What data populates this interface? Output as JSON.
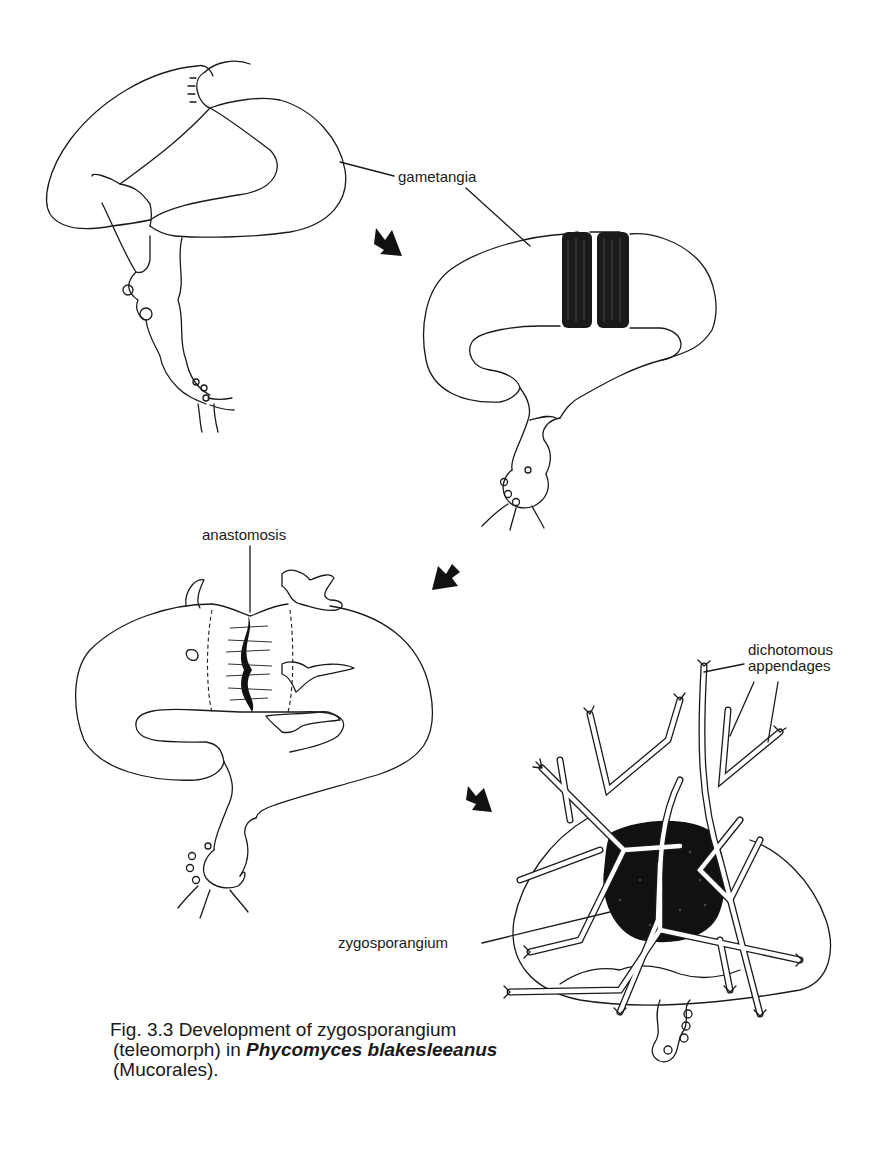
{
  "figure": {
    "labels": {
      "gametangia": "gametangia",
      "anastomosis": "anastomosis",
      "dichotomous_line1": "dichotomous",
      "dichotomous_line2": "appendages",
      "zygosporangium": "zygosporangium"
    },
    "stages": [
      {
        "id": 1,
        "description": "Gametangia in contact (early stage)"
      },
      {
        "id": 2,
        "description": "Gametangia with dark septal zones"
      },
      {
        "id": 3,
        "description": "Anastomosis between gametangia"
      },
      {
        "id": 4,
        "description": "Mature zygosporangium with dichotomous appendages"
      }
    ],
    "arrows": [
      {
        "from_stage": 1,
        "to_stage": 2,
        "direction": "down-right"
      },
      {
        "from_stage": 2,
        "to_stage": 3,
        "direction": "down-left"
      },
      {
        "from_stage": 3,
        "to_stage": 4,
        "direction": "down-right"
      }
    ],
    "caption": {
      "line1": "Fig. 3.3 Development of zygosporangium",
      "line2_prefix": "(teleomorph) in ",
      "line2_species": "Phycomyces blakesleeanus",
      "line3": "(Mucorales)."
    }
  }
}
